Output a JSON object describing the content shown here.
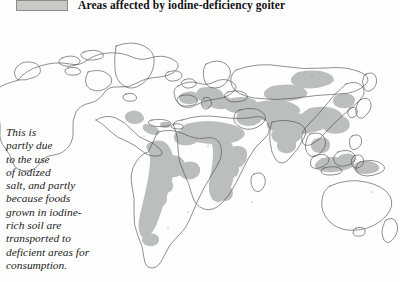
{
  "header": {
    "legend_swatch_name": "legend-color-swatch",
    "legend_swatch_color": "#c9c9c6",
    "title": "Areas affected by iodine-deficiency goiter"
  },
  "map": {
    "type": "world-map",
    "projection": "equirectangular",
    "ocean_color": "#fefefe",
    "land_fill": "#ffffff",
    "land_outline_color": "#4a4a4a",
    "affected_area_color": "#b8bcb8",
    "affected_regions": [
      "Andes / western South America",
      "Central Africa",
      "Sahel / West Africa",
      "Mediterranean / southern Europe",
      "Central Asia",
      "Himalayas / northern India",
      "China",
      "Southeast Asia / Indonesia",
      "Papua New Guinea",
      "Mexico / Central America"
    ]
  },
  "caption": {
    "lines": [
      "This is",
      "partly due",
      "to the use",
      "of iodized",
      "salt, and partly",
      "because foods",
      "grown in iodine-",
      "rich soil are",
      "transported to",
      "deficient areas for",
      "consumption."
    ]
  }
}
